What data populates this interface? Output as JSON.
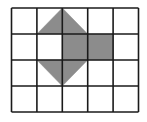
{
  "figure": {
    "grid": {
      "cols": 5,
      "rows": 4,
      "left": 11.5,
      "top": 8,
      "cell_width": 25.4,
      "cell_height": 26,
      "line_color": "#1a1a1a",
      "line_width": 1.6
    },
    "shape": {
      "fill": "#8c8c8c",
      "pieces": [
        {
          "name": "top-triangle",
          "points_grid": [
            [
              2,
              0
            ],
            [
              1,
              1
            ],
            [
              3,
              1
            ]
          ]
        },
        {
          "name": "middle-square",
          "points_grid": [
            [
              2,
              1
            ],
            [
              4,
              1
            ],
            [
              4,
              2
            ],
            [
              2,
              2
            ]
          ]
        },
        {
          "name": "bottom-triangle",
          "points_grid": [
            [
              1,
              2
            ],
            [
              3,
              2
            ],
            [
              2,
              3
            ]
          ]
        }
      ]
    },
    "background": "#ffffff"
  }
}
